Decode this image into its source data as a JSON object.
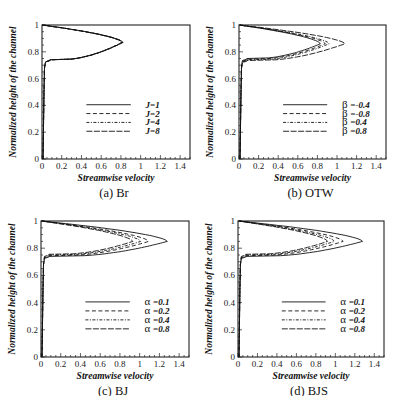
{
  "chart_data": [
    {
      "type": "line",
      "panel": "a",
      "caption": "(a) Br",
      "xlabel": "Streamwise velocity",
      "ylabel": "Normalized height of the channel",
      "xlim": [
        0,
        1.5
      ],
      "ylim": [
        0,
        1
      ],
      "xticks": [
        "0",
        "0.2",
        "0.4",
        "0.6",
        "0.8",
        "1",
        "1.2",
        "1.4"
      ],
      "yticks": [
        "0",
        "0.2",
        "0.4",
        "0.6",
        "0.8",
        "1"
      ],
      "grid": false,
      "legend_position": "center-right",
      "legend_symbol": "",
      "series": [
        {
          "name": "J=1",
          "label": "J=1",
          "style": "solid",
          "peak_u": 0.82,
          "peak_y": 0.87,
          "base_y": 0.74
        },
        {
          "name": "J=2",
          "label": "J=2",
          "style": "dashed",
          "peak_u": 0.82,
          "peak_y": 0.87,
          "base_y": 0.74
        },
        {
          "name": "J=4",
          "label": "J=4",
          "style": "dashdot",
          "peak_u": 0.81,
          "peak_y": 0.87,
          "base_y": 0.74
        },
        {
          "name": "J=8",
          "label": "J=8",
          "style": "longdash",
          "peak_u": 0.81,
          "peak_y": 0.87,
          "base_y": 0.74
        }
      ]
    },
    {
      "type": "line",
      "panel": "b",
      "caption": "(b) OTW",
      "xlabel": "Streamwise velocity",
      "ylabel": "Normalized height of the channel",
      "xlim": [
        0,
        1.5
      ],
      "ylim": [
        0,
        1
      ],
      "xticks": [
        "0",
        "0.2",
        "0.4",
        "0.6",
        "0.8",
        "1",
        "1.2",
        "1.4"
      ],
      "yticks": [
        "0",
        "0.2",
        "0.4",
        "0.6",
        "0.8",
        "1"
      ],
      "grid": false,
      "legend_position": "center-right",
      "legend_symbol": "β",
      "series": [
        {
          "name": "β=-0.4",
          "label": "=-0.4",
          "style": "solid",
          "peak_u": 0.83,
          "peak_y": 0.86,
          "base_y": 0.75
        },
        {
          "name": "β=-0.8",
          "label": "=-0.8",
          "style": "dashed",
          "peak_u": 0.88,
          "peak_y": 0.86,
          "base_y": 0.745
        },
        {
          "name": "β=0.4",
          "label": "=0.4",
          "style": "dashdot",
          "peak_u": 0.92,
          "peak_y": 0.86,
          "base_y": 0.74
        },
        {
          "name": "β=0.8",
          "label": "=0.8",
          "style": "longdash",
          "peak_u": 1.08,
          "peak_y": 0.86,
          "base_y": 0.735
        }
      ]
    },
    {
      "type": "line",
      "panel": "c",
      "caption": "(c) BJ",
      "xlabel": "Streamwise velocity",
      "ylabel": "Normalized height of the channel",
      "xlim": [
        0,
        1.5
      ],
      "ylim": [
        0,
        1
      ],
      "xticks": [
        "0",
        "0.2",
        "0.4",
        "0.6",
        "0.8",
        "1",
        "1.2",
        "1.4"
      ],
      "yticks": [
        "0",
        "0.2",
        "0.4",
        "0.6",
        "0.8",
        "1"
      ],
      "grid": false,
      "legend_position": "center-right",
      "legend_symbol": "α",
      "series": [
        {
          "name": "α=0.1",
          "label": "=0.1",
          "style": "solid",
          "peak_u": 1.28,
          "peak_y": 0.85,
          "base_y": 0.74
        },
        {
          "name": "α=0.2",
          "label": "=0.2",
          "style": "dashed",
          "peak_u": 1.09,
          "peak_y": 0.85,
          "base_y": 0.745
        },
        {
          "name": "α=0.4",
          "label": "=0.4",
          "style": "dashdot",
          "peak_u": 1.01,
          "peak_y": 0.85,
          "base_y": 0.75
        },
        {
          "name": "α=0.8",
          "label": "=0.8",
          "style": "longdash",
          "peak_u": 0.93,
          "peak_y": 0.85,
          "base_y": 0.755
        }
      ]
    },
    {
      "type": "line",
      "panel": "d",
      "caption": "(d) BJS",
      "xlabel": "Streamwise velocity",
      "ylabel": "Normalized height of the channel",
      "xlim": [
        0,
        1.5
      ],
      "ylim": [
        0,
        1
      ],
      "xticks": [
        "0",
        "0.2",
        "0.4",
        "0.6",
        "0.8",
        "1",
        "1.2",
        "1.4"
      ],
      "yticks": [
        "0",
        "0.2",
        "0.4",
        "0.6",
        "0.8",
        "1"
      ],
      "grid": false,
      "legend_position": "center-right",
      "legend_symbol": "α",
      "series": [
        {
          "name": "α=0.1",
          "label": "=0.1",
          "style": "solid",
          "peak_u": 1.28,
          "peak_y": 0.85,
          "base_y": 0.74
        },
        {
          "name": "α=0.2",
          "label": "=0.2",
          "style": "dashed",
          "peak_u": 1.08,
          "peak_y": 0.85,
          "base_y": 0.745
        },
        {
          "name": "α=0.4",
          "label": "=0.4",
          "style": "dashdot",
          "peak_u": 0.99,
          "peak_y": 0.85,
          "base_y": 0.75
        },
        {
          "name": "α=0.8",
          "label": "=0.8",
          "style": "longdash",
          "peak_u": 0.92,
          "peak_y": 0.85,
          "base_y": 0.755
        }
      ]
    }
  ],
  "layout": {
    "panels": [
      {
        "left": 42,
        "top": 25,
        "width": 148,
        "height": 134
      },
      {
        "left": 239,
        "top": 25,
        "width": 147,
        "height": 134
      },
      {
        "left": 41,
        "top": 221,
        "width": 148,
        "height": 136
      },
      {
        "left": 238,
        "top": 221,
        "width": 146,
        "height": 136
      }
    ]
  }
}
